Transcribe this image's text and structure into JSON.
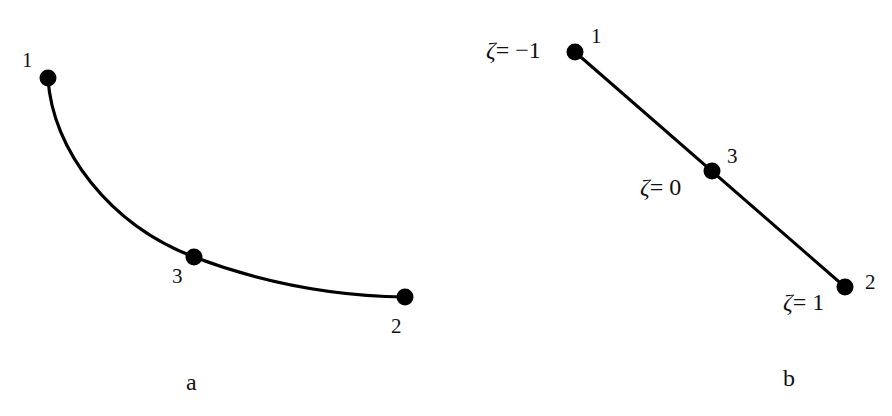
{
  "figure": {
    "panel_a": {
      "caption": "a",
      "description": "Curved 3-node element",
      "nodes": [
        {
          "id": "1",
          "label": "1",
          "x": 48,
          "y": 78
        },
        {
          "id": "3",
          "label": "3",
          "x": 194,
          "y": 257
        },
        {
          "id": "2",
          "label": "2",
          "x": 405,
          "y": 297
        }
      ]
    },
    "panel_b": {
      "caption": "b",
      "description": "Straight 3-node element in natural coordinate",
      "nodes": [
        {
          "id": "1",
          "label": "1",
          "x": 575,
          "y": 52,
          "coord_label": "ζ= −1",
          "zeta_symbol": "ζ",
          "zeta_value": "= −1"
        },
        {
          "id": "3",
          "label": "3",
          "x": 712,
          "y": 171,
          "coord_label": "ζ= 0",
          "zeta_symbol": "ζ",
          "zeta_value": "= 0"
        },
        {
          "id": "2",
          "label": "2",
          "x": 845,
          "y": 287,
          "coord_label": "ζ= 1",
          "zeta_symbol": "ζ",
          "zeta_value": "= 1"
        }
      ]
    },
    "colors": {
      "line": "#000000",
      "node": "#000000",
      "text": "#111111",
      "background": "#ffffff"
    }
  }
}
